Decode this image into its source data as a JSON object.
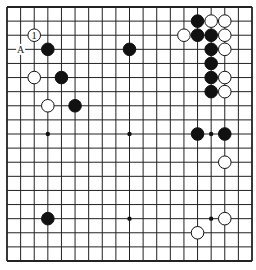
{
  "diagram": {
    "type": "go-board",
    "size": 19,
    "background": "#ffffff",
    "line_color": "#222222",
    "geometry": {
      "left": 7,
      "top": 7,
      "right": 252,
      "bottom": 261,
      "stone_radius": 6.3
    },
    "star_points": [
      [
        3,
        3
      ],
      [
        9,
        3
      ],
      [
        15,
        3
      ],
      [
        3,
        9
      ],
      [
        9,
        9
      ],
      [
        15,
        9
      ],
      [
        3,
        15
      ],
      [
        9,
        15
      ],
      [
        15,
        15
      ]
    ],
    "stones": {
      "black": [
        [
          3,
          3
        ],
        [
          4,
          5
        ],
        [
          5,
          7
        ],
        [
          9,
          3
        ],
        [
          14,
          1
        ],
        [
          14,
          2
        ],
        [
          15,
          2
        ],
        [
          15,
          3
        ],
        [
          15,
          4
        ],
        [
          15,
          5
        ],
        [
          15,
          6
        ],
        [
          14,
          9
        ],
        [
          16,
          9
        ],
        [
          3,
          15
        ]
      ],
      "white": [
        [
          2,
          5
        ],
        [
          3,
          7
        ],
        [
          15,
          1
        ],
        [
          16,
          1
        ],
        [
          13,
          2
        ],
        [
          16,
          2
        ],
        [
          16,
          3
        ],
        [
          16,
          5
        ],
        [
          16,
          6
        ],
        [
          16,
          11
        ],
        [
          16,
          15
        ],
        [
          14,
          16
        ]
      ]
    },
    "numbered_stones": [
      {
        "col": 2,
        "row": 2,
        "color": "white",
        "label": "1"
      }
    ],
    "letter_marks": [
      {
        "col": 1,
        "row": 3,
        "label": "A"
      }
    ]
  }
}
